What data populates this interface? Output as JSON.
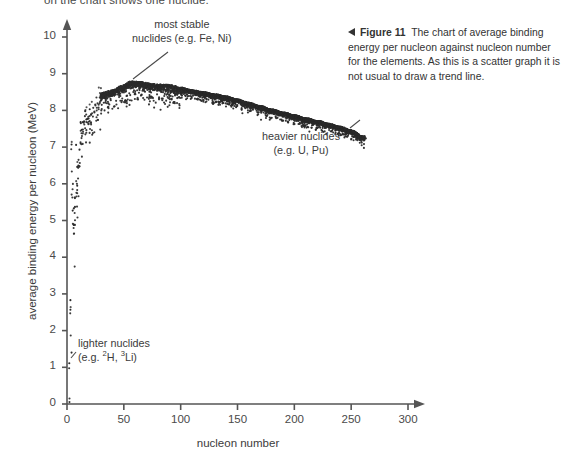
{
  "page": {
    "top_clipped_text": "on the chart shows one nuclide.",
    "background": "#ffffff",
    "ink": "#3b3b3b"
  },
  "caption": {
    "arrow_icon": "left-triangle-icon",
    "label": "Figure 11",
    "text": "The chart of average binding energy per nucleon against nucleon number for the elements. As this is a scatter graph it is not usual to draw a trend line."
  },
  "annotations": [
    {
      "id": "most-stable",
      "line1": "most stable",
      "line2": "nuclides (e.g. Fe, Ni)"
    },
    {
      "id": "heavier",
      "line1": "heavier nuclides",
      "line2": "(e.g. U, Pu)"
    },
    {
      "id": "lighter",
      "line1": "lighter nuclides",
      "line2_pre": "(e.g. ",
      "line2_sup1": "2",
      "line2_mid1": "H, ",
      "line2_sup2": "3",
      "line2_mid2": "Li)"
    }
  ],
  "chart_data": {
    "type": "scatter",
    "title": "",
    "xlabel": "nucleon number",
    "ylabel": "average binding energy per nucleon (MeV)",
    "xlim": [
      0,
      300
    ],
    "ylim": [
      0,
      10
    ],
    "xticks": [
      0,
      50,
      100,
      150,
      200,
      250,
      300
    ],
    "yticks": [
      0,
      1,
      2,
      3,
      4,
      5,
      6,
      7,
      8,
      9,
      10
    ],
    "grid": false,
    "legend": null,
    "marker": {
      "shape": "dot",
      "size": 1.6,
      "color": "#2b2b2b"
    },
    "axis_style": {
      "color": "#555555",
      "arrow_heads": true,
      "spines": [
        "left",
        "bottom"
      ]
    },
    "series": [
      {
        "name": "nuclides",
        "description": "average binding energy per nucleon versus nucleon number for ~2500 known nuclides; dense band peaking near A=56-62 at about 8.8 MeV and falling to about 7.3 MeV near A=260",
        "curve_anchors": {
          "x": [
            1,
            2,
            3,
            4,
            6,
            7,
            9,
            11,
            12,
            14,
            16,
            20,
            24,
            28,
            32,
            40,
            48,
            56,
            62,
            70,
            80,
            90,
            100,
            110,
            120,
            130,
            140,
            150,
            160,
            170,
            180,
            190,
            200,
            210,
            220,
            230,
            240,
            250,
            260
          ],
          "y": [
            0.0,
            1.11,
            2.57,
            7.07,
            5.33,
            5.61,
            6.46,
            6.93,
            7.68,
            7.48,
            7.98,
            8.03,
            8.26,
            8.45,
            8.49,
            8.55,
            8.67,
            8.79,
            8.79,
            8.75,
            8.71,
            8.7,
            8.62,
            8.55,
            8.5,
            8.44,
            8.38,
            8.3,
            8.21,
            8.12,
            8.03,
            7.95,
            7.87,
            7.79,
            7.72,
            7.64,
            7.56,
            7.46,
            7.3
          ]
        },
        "spread_note": "isobars at a given A scatter several tenths of a MeV below the stability ridge; spread is largest for A < 40"
      }
    ],
    "annotation_targets": [
      {
        "text": "most stable nuclides (e.g. Fe, Ni)",
        "x": 56,
        "y": 8.8
      },
      {
        "text": "heavier nuclides (e.g. U, Pu)",
        "x": 238,
        "y": 7.6
      },
      {
        "text": "lighter nuclides (e.g. 2H, 3Li)",
        "x": 3,
        "y": 1.3
      }
    ]
  }
}
